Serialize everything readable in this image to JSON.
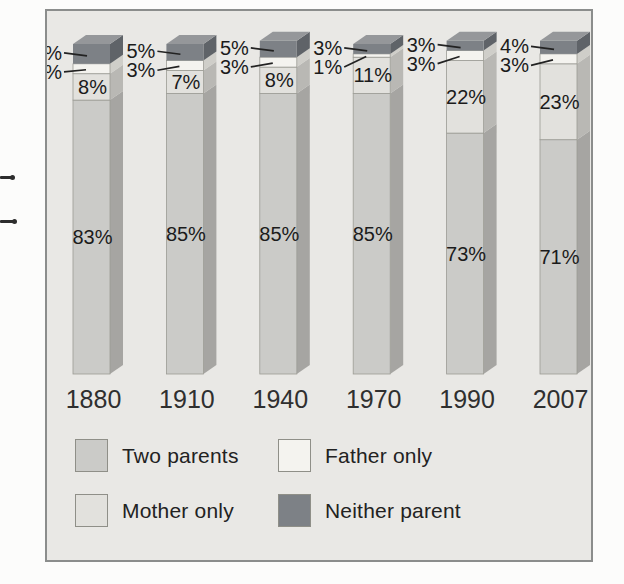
{
  "page": {
    "background": "#fcfcfb"
  },
  "frame": {
    "background": "#e9e8e5",
    "border_color": "#8b8d8c"
  },
  "text_colors": {
    "segment_labels": "#1b1b1b",
    "years": "#2f2f2f",
    "legend": "#222222"
  },
  "chart_data": {
    "type": "bar",
    "variant": "stacked-3d-column",
    "title": "",
    "xlabel": "",
    "ylabel": "",
    "ylim": [
      0,
      100
    ],
    "axes_visible": false,
    "grid": false,
    "value_suffix": "%",
    "categories": [
      "1880",
      "1910",
      "1940",
      "1970",
      "1990",
      "2007"
    ],
    "series": [
      {
        "name": "Two parents",
        "color": "#cbcbc8",
        "side_color": "#a6a5a2",
        "values": [
          83,
          85,
          85,
          85,
          73,
          71
        ],
        "label_placement": "inside"
      },
      {
        "name": "Mother only",
        "color": "#e2e1dd",
        "side_color": "#b9b8b4",
        "values": [
          8,
          7,
          8,
          11,
          22,
          23
        ],
        "label_placement": "inside"
      },
      {
        "name": "Father only",
        "color": "#f4f3ef",
        "side_color": "#cfcec9",
        "values": [
          3,
          3,
          3,
          1,
          3,
          3
        ],
        "label_placement": "outside-left"
      },
      {
        "name": "Neither parent",
        "color": "#7d8186",
        "side_color": "#5f6368",
        "top_color": "#95979a",
        "values": [
          6,
          5,
          5,
          3,
          3,
          4
        ],
        "label_placement": "outside-left"
      }
    ],
    "legend_position": "bottom",
    "legend_order": [
      "Two parents",
      "Father only",
      "Mother only",
      "Neither parent"
    ]
  }
}
